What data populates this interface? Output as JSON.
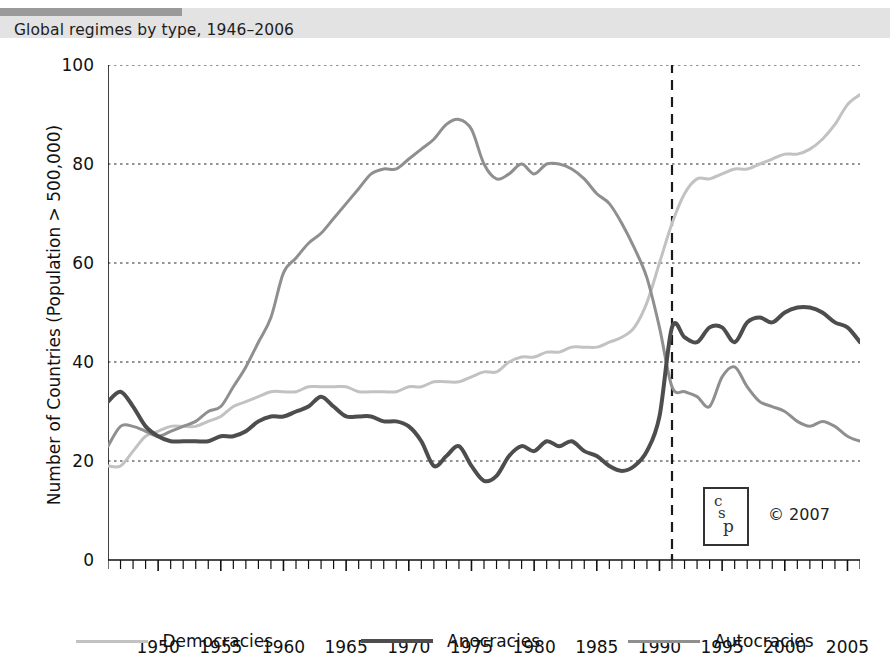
{
  "header": {
    "title": "Global regimes by type, 1946–2006"
  },
  "axes": {
    "ylabel": "Number of Countries (Population > 500,000)",
    "xlabel": "",
    "ytick_labels": [
      "0",
      "20",
      "40",
      "60",
      "80",
      "100"
    ],
    "xtick_labels": [
      "1950",
      "1955",
      "1960",
      "1965",
      "1970",
      "1975",
      "1980",
      "1985",
      "1990",
      "1995",
      "2000",
      "2005"
    ]
  },
  "legend": {
    "items": [
      {
        "label": "Democracies",
        "color": "#c2c2c2",
        "width": 3
      },
      {
        "label": "Anocracies",
        "color": "#4d4d4d",
        "width": 4
      },
      {
        "label": "Autocracies",
        "color": "#8f8f8f",
        "width": 3
      }
    ]
  },
  "watermark": {
    "logo_letters": [
      "c",
      "s",
      "p"
    ],
    "copyright": "© 2007"
  },
  "chart_data": {
    "type": "line",
    "title": "Global regimes by type, 1946–2006",
    "xlabel": "",
    "ylabel": "Number of Countries (Population > 500,000)",
    "xlim": [
      1946,
      2006
    ],
    "ylim": [
      0,
      100
    ],
    "yticks": [
      0,
      20,
      40,
      60,
      80,
      100
    ],
    "xticks": [
      1950,
      1955,
      1960,
      1965,
      1970,
      1975,
      1980,
      1985,
      1990,
      1995,
      2000,
      2005
    ],
    "grid": "horizontal-dotted",
    "legend_position": "bottom",
    "annotations": [
      {
        "type": "vline",
        "x": 1991,
        "style": "dashed",
        "color": "#1a1a1a"
      }
    ],
    "x": [
      1946,
      1947,
      1948,
      1949,
      1950,
      1951,
      1952,
      1953,
      1954,
      1955,
      1956,
      1957,
      1958,
      1959,
      1960,
      1961,
      1962,
      1963,
      1964,
      1965,
      1966,
      1967,
      1968,
      1969,
      1970,
      1971,
      1972,
      1973,
      1974,
      1975,
      1976,
      1977,
      1978,
      1979,
      1980,
      1981,
      1982,
      1983,
      1984,
      1985,
      1986,
      1987,
      1988,
      1989,
      1990,
      1991,
      1992,
      1993,
      1994,
      1995,
      1996,
      1997,
      1998,
      1999,
      2000,
      2001,
      2002,
      2003,
      2004,
      2005,
      2006
    ],
    "series": [
      {
        "name": "Democracies",
        "color": "#c2c2c2",
        "width": 3,
        "values": [
          19,
          19,
          22,
          25,
          26,
          27,
          27,
          27,
          28,
          29,
          31,
          32,
          33,
          34,
          34,
          34,
          35,
          35,
          35,
          35,
          34,
          34,
          34,
          34,
          35,
          35,
          36,
          36,
          36,
          37,
          38,
          38,
          40,
          41,
          41,
          42,
          42,
          43,
          43,
          43,
          44,
          45,
          47,
          52,
          60,
          68,
          74,
          77,
          77,
          78,
          79,
          79,
          80,
          81,
          82,
          82,
          83,
          85,
          88,
          92,
          94
        ]
      },
      {
        "name": "Anocracies",
        "color": "#4d4d4d",
        "width": 4,
        "values": [
          32,
          34,
          31,
          27,
          25,
          24,
          24,
          24,
          24,
          25,
          25,
          26,
          28,
          29,
          29,
          30,
          31,
          33,
          31,
          29,
          29,
          29,
          28,
          28,
          27,
          24,
          19,
          21,
          23,
          19,
          16,
          17,
          21,
          23,
          22,
          24,
          23,
          24,
          22,
          21,
          19,
          18,
          19,
          22,
          29,
          47,
          45,
          44,
          47,
          47,
          44,
          48,
          49,
          48,
          50,
          51,
          51,
          50,
          48,
          47,
          44
        ]
      },
      {
        "name": "Autocracies",
        "color": "#8f8f8f",
        "width": 3,
        "values": [
          23,
          27,
          27,
          26,
          25,
          26,
          27,
          28,
          30,
          31,
          35,
          39,
          44,
          49,
          58,
          61,
          64,
          66,
          69,
          72,
          75,
          78,
          79,
          79,
          81,
          83,
          85,
          88,
          89,
          87,
          80,
          77,
          78,
          80,
          78,
          80,
          80,
          79,
          77,
          74,
          72,
          68,
          63,
          57,
          47,
          35,
          34,
          33,
          31,
          37,
          39,
          35,
          32,
          31,
          30,
          28,
          27,
          28,
          27,
          25,
          24
        ]
      }
    ]
  }
}
